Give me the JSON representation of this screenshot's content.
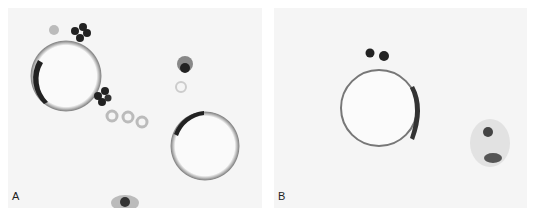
{
  "figure": {
    "panels": [
      {
        "label": "A",
        "description": "Two large spherical cells with crescent-shaped dark nuclei pushed to the periphery, surrounded by small dark clustered cells and pale red blood cells"
      },
      {
        "label": "B",
        "description": "One large round cell with thin rim and peripheral flattened nucleus, small dark cells at top, and a separate irregular cell cluster at right"
      }
    ]
  }
}
